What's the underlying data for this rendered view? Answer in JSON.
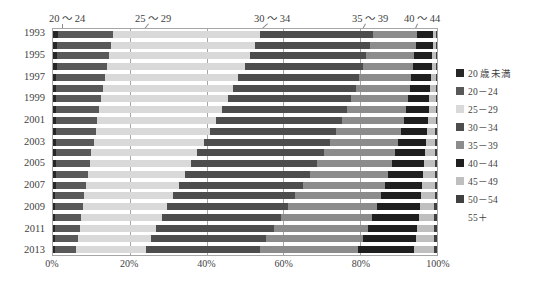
{
  "chart_data": {
    "type": "bar",
    "orientation": "horizontal",
    "stacked": true,
    "normalized": true,
    "title": "",
    "xlabel": "",
    "ylabel": "",
    "xlim": [
      0,
      100
    ],
    "grid": true,
    "legend_position": "right",
    "categories": [
      "1993",
      "1994",
      "1995",
      "1996",
      "1997",
      "1998",
      "1999",
      "2000",
      "2001",
      "2002",
      "2003",
      "2004",
      "2005",
      "2006",
      "2007",
      "2008",
      "2009",
      "2010",
      "2011",
      "2012",
      "2013"
    ],
    "y_tick_labels": [
      "1993",
      "",
      "1995",
      "",
      "1997",
      "",
      "1999",
      "",
      "2001",
      "",
      "2003",
      "",
      "2005",
      "",
      "2007",
      "",
      "2009",
      "",
      "2011",
      "",
      "2013"
    ],
    "x_tick_labels": [
      "0%",
      "20%",
      "40%",
      "60%",
      "80%",
      "100%"
    ],
    "x_tick_values": [
      0,
      20,
      40,
      60,
      80,
      100
    ],
    "series": [
      {
        "name": "20 歳未満",
        "color": "#262626",
        "values": [
          1.2,
          1.1,
          1.0,
          1.0,
          0.9,
          0.9,
          0.9,
          0.8,
          0.8,
          0.8,
          0.8,
          0.7,
          0.7,
          0.7,
          0.7,
          0.6,
          0.6,
          0.6,
          0.6,
          0.5,
          0.5
        ]
      },
      {
        "name": "20 - 24",
        "color": "#595959",
        "values": [
          14.3,
          13.9,
          13.5,
          13.1,
          12.6,
          12.2,
          11.7,
          11.2,
          10.7,
          10.3,
          9.8,
          9.3,
          8.9,
          8.4,
          8.0,
          7.6,
          7.2,
          6.8,
          6.4,
          6.0,
          5.6
        ]
      },
      {
        "name": "25 - 29",
        "color": "#d9d9d9",
        "values": [
          38.5,
          37.6,
          36.7,
          35.8,
          34.8,
          33.9,
          32.9,
          32.0,
          31.0,
          29.9,
          28.8,
          27.6,
          26.5,
          25.3,
          24.2,
          23.1,
          22.0,
          21.0,
          20.0,
          19.0,
          18.2
        ]
      },
      {
        "name": "30 - 34",
        "color": "#4d4d4d",
        "values": [
          29.3,
          29.9,
          30.4,
          30.9,
          31.4,
          31.8,
          32.2,
          32.5,
          32.7,
          32.9,
          33.0,
          33.0,
          32.9,
          32.7,
          32.4,
          32.0,
          31.6,
          31.1,
          30.6,
          30.1,
          29.6
        ]
      },
      {
        "name": "35 - 39",
        "color": "#8c8c8c",
        "values": [
          11.5,
          12.0,
          12.5,
          13.0,
          13.6,
          14.2,
          14.8,
          15.5,
          16.2,
          17.0,
          17.8,
          18.7,
          19.6,
          20.5,
          21.4,
          22.3,
          23.1,
          23.9,
          24.6,
          25.2,
          25.7
        ]
      },
      {
        "name": "40 - 44",
        "color": "#1f1f1f",
        "values": [
          4.2,
          4.4,
          4.6,
          4.8,
          5.1,
          5.3,
          5.6,
          5.9,
          6.3,
          6.7,
          7.2,
          7.7,
          8.3,
          9.0,
          9.7,
          10.5,
          11.3,
          12.1,
          12.9,
          13.7,
          14.5
        ]
      },
      {
        "name": "45 - 49",
        "color": "#bfbfbf",
        "values": [
          0.8,
          0.9,
          1.0,
          1.1,
          1.3,
          1.4,
          1.6,
          1.8,
          2.0,
          2.2,
          2.4,
          2.7,
          2.9,
          3.2,
          3.4,
          3.6,
          3.8,
          4.1,
          4.4,
          4.8,
          5.2
        ]
      },
      {
        "name": "50 - 54",
        "color": "#404040",
        "values": [
          0.15,
          0.15,
          0.2,
          0.2,
          0.25,
          0.25,
          0.3,
          0.3,
          0.3,
          0.35,
          0.4,
          0.4,
          0.45,
          0.45,
          0.5,
          0.5,
          0.55,
          0.6,
          0.6,
          0.65,
          0.7
        ]
      },
      {
        "name": "55 +",
        "color": "#ffffff",
        "values": [
          0.05,
          0.05,
          0.1,
          0.1,
          0.05,
          0.05,
          0.05,
          0.05,
          0.05,
          0.05,
          0.05,
          0.1,
          0.1,
          0.1,
          0.1,
          0.1,
          0.1,
          0.1,
          0.1,
          0.1,
          0.1
        ]
      }
    ]
  },
  "callouts": [
    {
      "label": "20 ～ 24",
      "label_x": 67,
      "tip_x": 63,
      "tip_y": 33
    },
    {
      "label": "25 ～ 29",
      "label_x": 153,
      "tip_x": 138,
      "tip_y": 38
    },
    {
      "label": "30 ～ 34",
      "label_x": 272,
      "tip_x": 256,
      "tip_y": 35
    },
    {
      "label": "35 ～ 39",
      "label_x": 370,
      "tip_x": 358,
      "tip_y": 38
    },
    {
      "label": "40 ～ 44",
      "label_x": 422,
      "tip_x": 414,
      "tip_y": 33
    }
  ],
  "legend": {
    "items": [
      {
        "label": "20 歳未満",
        "color": "#262626",
        "has_swatch": true
      },
      {
        "label": "20－24",
        "color": "#595959",
        "has_swatch": true
      },
      {
        "label": "25－29",
        "color": "#d9d9d9",
        "has_swatch": true
      },
      {
        "label": "30－34",
        "color": "#4d4d4d",
        "has_swatch": true
      },
      {
        "label": "35－39",
        "color": "#8c8c8c",
        "has_swatch": true
      },
      {
        "label": "40－44",
        "color": "#1f1f1f",
        "has_swatch": true
      },
      {
        "label": "45－49",
        "color": "#bfbfbf",
        "has_swatch": true
      },
      {
        "label": "50－54",
        "color": "#404040",
        "has_swatch": true
      },
      {
        "label": "55＋",
        "color": "#ffffff",
        "has_swatch": false
      }
    ]
  },
  "colors": {
    "axis": "#a6a6a6",
    "grid": "#a6a6a6",
    "text": "#3f3f3f",
    "background": "#ffffff"
  }
}
